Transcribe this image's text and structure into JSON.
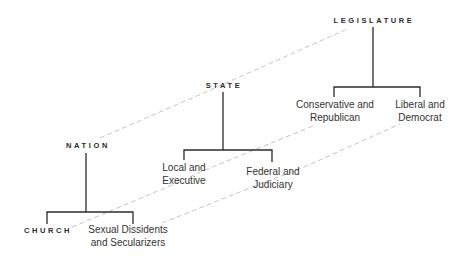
{
  "diagram": {
    "type": "hierarchy-tree",
    "trees": [
      {
        "root": "NATION",
        "children": [
          {
            "line1": "CHURCH",
            "line2": ""
          },
          {
            "line1": "Sexual Dissidents",
            "line2": "and Secularizers"
          }
        ]
      },
      {
        "root": "STATE",
        "children": [
          {
            "line1": "Local and",
            "line2": "Executive"
          },
          {
            "line1": "Federal and",
            "line2": "Judiciary"
          }
        ]
      },
      {
        "root": "LEGISLATURE",
        "children": [
          {
            "line1": "Conservative and",
            "line2": "Republican"
          },
          {
            "line1": "Liberal and",
            "line2": "Democrat"
          }
        ]
      }
    ],
    "connectors": [
      {
        "from": "NATION",
        "via": "STATE",
        "to": "LEGISLATURE",
        "style": "dashed"
      },
      {
        "from": "CHURCH",
        "via": "Local and Executive",
        "to": "Conservative and Republican",
        "style": "dashed"
      },
      {
        "from": "Sexual Dissidents and Secularizers",
        "via": "Federal and Judiciary",
        "to": "Liberal and Democrat",
        "style": "dashed"
      }
    ],
    "colors": {
      "tree_line": "#2a2a2a",
      "dashed_line": "#b0b0b0",
      "text": "#2a2a2a"
    }
  }
}
